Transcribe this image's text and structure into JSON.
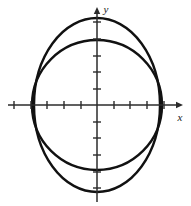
{
  "figure": {
    "title": "",
    "background_color": "#ffffff",
    "curve_color": "#111111",
    "axis_color": "#2b2b2b",
    "width": 191,
    "height": 206
  },
  "axes": {
    "x_label": "x",
    "y_label": "y",
    "origin": {
      "x": 97,
      "y": 105
    },
    "x_axis": {
      "start_x": 8,
      "end_x": 180,
      "y": 105
    },
    "y_axis": {
      "x": 97,
      "start_y": 10,
      "end_y": 202
    },
    "tick_spacing_px": 16.5,
    "tick_half_length_px": 4,
    "x_ticks_px": [
      14,
      31,
      47,
      64,
      81,
      114,
      130,
      147,
      164
    ],
    "y_ticks_px": [
      22,
      39,
      56,
      72,
      89,
      122,
      138,
      155,
      172,
      188
    ],
    "arrow_x": true,
    "arrow_y": true
  },
  "chart_data": {
    "type": "line",
    "title": "",
    "xlabel": "x",
    "ylabel": "y",
    "grid": false,
    "legend": "none",
    "xlim": [
      -5.4,
      5.1
    ],
    "ylim": [
      -5.75,
      5.75
    ],
    "series": [
      {
        "name": "circle",
        "shape": "circle",
        "center": [
          0,
          0
        ],
        "radius": 3.96,
        "center_px": [
          97,
          105
        ],
        "radius_px": 65,
        "x_intercepts": [
          -3.96,
          3.96
        ],
        "y_intercepts": [
          -3.96,
          3.96
        ],
        "linewidth_px": 2.4
      },
      {
        "name": "ellipse",
        "shape": "ellipse",
        "center": [
          0,
          0
        ],
        "semi_axis_x": 3.84,
        "semi_axis_y": 5.3,
        "center_px": [
          97,
          105
        ],
        "semi_axis_x_px": 63,
        "semi_axis_y_px": 87,
        "x_intercepts": [
          -3.84,
          3.84
        ],
        "y_intercepts": [
          -5.3,
          5.3
        ],
        "linewidth_px": 2.4
      }
    ],
    "annotations": []
  }
}
